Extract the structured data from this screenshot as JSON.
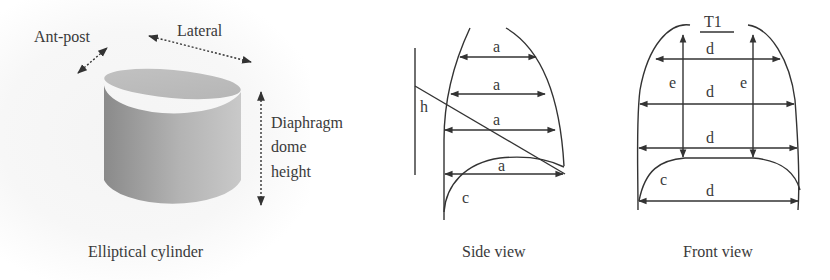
{
  "panels": {
    "cylinder": {
      "caption": "Elliptical cylinder",
      "labels": {
        "ant_post": "Ant-post",
        "lateral": "Lateral",
        "dome_line1": "Diaphragm",
        "dome_line2": "dome",
        "dome_line3": "height"
      }
    },
    "side_view": {
      "caption": "Side view",
      "labels": {
        "a1": "a",
        "a2": "a",
        "a3": "a",
        "a4": "a",
        "h": "h",
        "c": "c"
      }
    },
    "front_view": {
      "caption": "Front view",
      "labels": {
        "t1": "T1",
        "d1": "d",
        "d2": "d",
        "d3": "d",
        "d4": "d",
        "e_left": "e",
        "e_right": "e",
        "c": "c"
      }
    }
  },
  "colors": {
    "line": "#333333",
    "cylinder_light": "#c8c8c8",
    "cylinder_dark": "#8c8c8c",
    "cylinder_top": "#bdbdbd"
  }
}
